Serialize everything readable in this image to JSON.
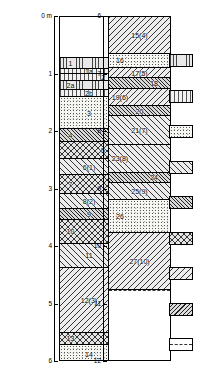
{
  "figure": {
    "type": "stratigraphic-log",
    "unit_label": "0 m",
    "panels": [
      {
        "id": "left-column",
        "depth_top": 0,
        "depth_bottom": 6,
        "axis_ticks": [
          "0 m",
          "1",
          "2",
          "3",
          "4",
          "5",
          "6"
        ],
        "beds": [
          {
            "label": "",
            "pattern": "p-blank",
            "top_m": 0.0,
            "base_m": 1.22
          },
          {
            "label": "1",
            "pattern": "p-vert",
            "top_m": 1.22,
            "base_m": 1.55
          },
          {
            "label": "1a",
            "pattern": "p-vertw",
            "top_m": 1.55,
            "base_m": 1.7
          },
          {
            "label": "2",
            "pattern": "p-vertw",
            "top_m": 1.7,
            "base_m": 1.9
          },
          {
            "label": "2a",
            "pattern": "p-vert",
            "top_m": 1.9,
            "base_m": 2.17
          },
          {
            "label": "2b",
            "pattern": "p-vertw",
            "top_m": 2.17,
            "base_m": 2.4
          },
          {
            "label": "3",
            "pattern": "p-dots",
            "top_m": 2.4,
            "base_m": 3.35
          },
          {
            "label": "4",
            "pattern": "p-diagd",
            "top_m": 3.35,
            "base_m": 3.72
          },
          {
            "label": "5",
            "pattern": "p-cross",
            "top_m": 3.72,
            "base_m": 4.25
          },
          {
            "label": "6(1)",
            "pattern": "p-diag",
            "top_m": 4.25,
            "base_m": 4.72
          },
          {
            "label": "7",
            "pattern": "p-cross",
            "top_m": 4.72,
            "base_m": 5.28
          },
          {
            "label": "8(2)",
            "pattern": "p-diag",
            "top_m": 5.28,
            "base_m": 5.72
          },
          {
            "label": "9",
            "pattern": "p-diagd",
            "top_m": 5.72,
            "base_m": 6.05
          },
          {
            "label": "10",
            "pattern": "p-cross",
            "top_m": 6.05,
            "base_m": 6.78
          },
          {
            "label": "11",
            "pattern": "p-diag",
            "top_m": 6.78,
            "base_m": 7.48
          },
          {
            "label": "12(3)",
            "pattern": "p-diagl",
            "top_m": 7.48,
            "base_m": 9.42
          },
          {
            "label": "13",
            "pattern": "p-cross",
            "top_m": 9.42,
            "base_m": 9.8
          },
          {
            "label": "14",
            "pattern": "p-dots",
            "top_m": 9.8,
            "base_m": 10.3
          }
        ]
      },
      {
        "id": "right-column",
        "depth_top": 6,
        "depth_bottom": 12,
        "axis_ticks": [
          "6",
          "7",
          "8",
          "9",
          "10",
          "11",
          "12"
        ],
        "beds": [
          {
            "label": "15(4)",
            "pattern": "p-diagl",
            "top_m": 0.0,
            "base_m": 1.28
          },
          {
            "label": "16",
            "pattern": "p-dots",
            "top_m": 1.28,
            "base_m": 1.78
          },
          {
            "label": "17(5)",
            "pattern": "p-diagl",
            "top_m": 1.78,
            "base_m": 2.12
          },
          {
            "label": "18",
            "pattern": "p-diagd",
            "top_m": 2.12,
            "base_m": 2.52
          },
          {
            "label": "19(6)",
            "pattern": "p-diagl",
            "top_m": 2.52,
            "base_m": 3.1
          },
          {
            "label": "20",
            "pattern": "p-diagd",
            "top_m": 3.1,
            "base_m": 3.45
          },
          {
            "label": "21(7)",
            "pattern": "p-diag",
            "top_m": 3.45,
            "base_m": 4.45
          },
          {
            "label": "23(8)",
            "pattern": "p-diag",
            "top_m": 4.45,
            "base_m": 5.42
          },
          {
            "label": "24",
            "pattern": "p-diagd",
            "top_m": 5.42,
            "base_m": 5.78
          },
          {
            "label": "25(9)",
            "pattern": "p-diag",
            "top_m": 5.78,
            "base_m": 6.35
          },
          {
            "label": "26",
            "pattern": "p-dots",
            "top_m": 6.35,
            "base_m": 7.52
          },
          {
            "label": "27(10)",
            "pattern": "p-diagl",
            "top_m": 7.52,
            "base_m": 9.48
          },
          {
            "label": "",
            "pattern": "p-blank",
            "top_m": 9.48,
            "base_m": 12.0
          }
        ],
        "marker": {
          "name": "sample-arrow",
          "depth_m": 4.18
        }
      }
    ],
    "legend": {
      "items": [
        {
          "key": "legend-swatch-1",
          "pattern": "p-vert",
          "label": ""
        },
        {
          "key": "legend-swatch-2",
          "pattern": "p-vertw",
          "label": ""
        },
        {
          "key": "legend-swatch-3",
          "pattern": "p-dots",
          "label": ""
        },
        {
          "key": "legend-swatch-4",
          "pattern": "p-diag",
          "label": ""
        },
        {
          "key": "legend-swatch-5",
          "pattern": "p-diagd",
          "label": ""
        },
        {
          "key": "legend-swatch-6",
          "pattern": "p-cross",
          "label": ""
        },
        {
          "key": "legend-swatch-7",
          "pattern": "p-diagl",
          "label": ""
        },
        {
          "key": "legend-swatch-8",
          "pattern": "p-diagld",
          "label": ""
        },
        {
          "key": "legend-swatch-9",
          "pattern": "p-blank",
          "label": ""
        }
      ]
    }
  }
}
